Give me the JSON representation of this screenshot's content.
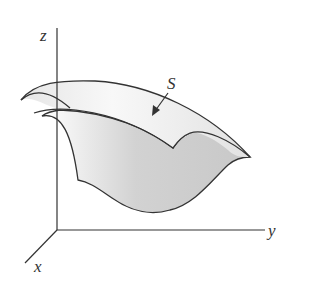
{
  "figure": {
    "axes": {
      "z_label": "z",
      "y_label": "y",
      "x_label": "x"
    },
    "surface_label": "S",
    "colors": {
      "line": "#333333",
      "surface_shade_dark": "#c8c8c8",
      "surface_shade_light": "#f2f2f2",
      "background": "#ffffff"
    }
  }
}
